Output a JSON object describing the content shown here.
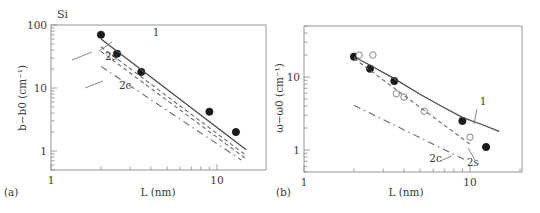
{
  "figure": {
    "material_label": "Si",
    "panel_a_label": "(a)",
    "panel_b_label": "(b)"
  },
  "chart_data": [
    {
      "type": "line",
      "panel": "a",
      "title": "Si",
      "xlabel": "L (nm)",
      "ylabel": "b−b0 (cm⁻¹)",
      "xscale": "log",
      "yscale": "log",
      "xlim": [
        1,
        20
      ],
      "ylim": [
        0.5,
        100
      ],
      "xticks": [
        "1",
        "10"
      ],
      "yticks": [
        "1",
        "10",
        "100"
      ],
      "grid": false,
      "series": [
        {
          "name": "experiment",
          "style": "filled-circle",
          "x": [
            2.0,
            2.5,
            3.5,
            9.0,
            13.0
          ],
          "y": [
            70,
            35,
            18,
            4.2,
            2.0
          ]
        },
        {
          "name": "1",
          "style": "solid",
          "x": [
            2.0,
            15.0
          ],
          "y": [
            60,
            1.05
          ]
        },
        {
          "name": "2s",
          "style": "dashed",
          "x": [
            2.0,
            15.0
          ],
          "y": [
            45,
            0.85
          ]
        },
        {
          "name": "2s-b",
          "style": "dashed",
          "x": [
            2.0,
            15.0
          ],
          "y": [
            38,
            0.75
          ]
        },
        {
          "name": "2c",
          "style": "dash-dot",
          "x": [
            2.0,
            14.0
          ],
          "y": [
            22,
            0.72
          ]
        }
      ],
      "annotations": [
        {
          "text": "1",
          "x": 4.3,
          "y": 68
        },
        {
          "text": "2s",
          "x": 2.3,
          "y": 28
        },
        {
          "text": "2c",
          "x": 2.8,
          "y": 9.5
        }
      ]
    },
    {
      "type": "line",
      "panel": "b",
      "title": "",
      "xlabel": "L (nm)",
      "ylabel": "ω−ω0 (cm⁻¹)",
      "xscale": "log",
      "yscale": "log",
      "xlim": [
        1,
        20
      ],
      "ylim": [
        0.5,
        50
      ],
      "xticks": [
        "1",
        "10"
      ],
      "yticks": [
        "1",
        "10"
      ],
      "grid": false,
      "series": [
        {
          "name": "experiment-filled",
          "style": "filled-circle",
          "x": [
            2.0,
            2.5,
            3.5,
            9.0,
            12.5
          ],
          "y": [
            19,
            13,
            8.8,
            2.5,
            1.1
          ]
        },
        {
          "name": "experiment-open",
          "style": "open-circle",
          "x": [
            2.15,
            2.6,
            3.6,
            4.0,
            5.3,
            10.0
          ],
          "y": [
            20,
            20,
            5.9,
            5.3,
            3.4,
            1.5
          ]
        },
        {
          "name": "1",
          "style": "solid",
          "x": [
            2.0,
            2.5,
            3.5,
            5.0,
            7.0,
            9.0,
            12.0,
            15.0
          ],
          "y": [
            19,
            14.5,
            9.5,
            5.8,
            3.8,
            2.8,
            2.2,
            1.8
          ]
        },
        {
          "name": "2s",
          "style": "dashed",
          "x": [
            2.0,
            10.0
          ],
          "y": [
            18,
            1.2
          ]
        },
        {
          "name": "2c",
          "style": "dash-dot",
          "x": [
            2.0,
            9.5
          ],
          "y": [
            4.1,
            0.72
          ]
        }
      ],
      "annotations": [
        {
          "text": "1",
          "x": 12.0,
          "y": 4.2
        },
        {
          "text": "2c",
          "x": 6.2,
          "y": 0.68
        },
        {
          "text": "2s",
          "x": 10.4,
          "y": 0.6
        }
      ]
    }
  ]
}
